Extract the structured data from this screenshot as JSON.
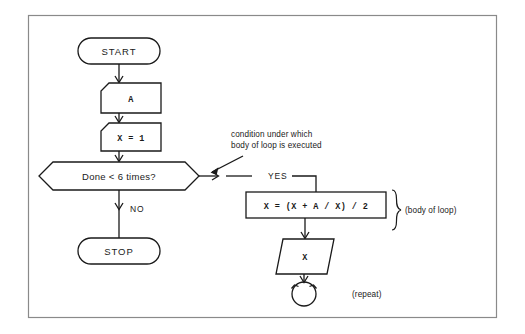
{
  "diagram": {
    "title_visible": false,
    "frame": {
      "present": true,
      "color": "#8a8a8a"
    },
    "ink_color": "#1a1a1a",
    "background": "#ffffff",
    "nodes": {
      "start": {
        "label": "START",
        "shape": "terminator"
      },
      "input_a": {
        "label": "A",
        "shape": "read-box"
      },
      "init_x": {
        "label": "X  =  1",
        "shape": "read-box"
      },
      "decision": {
        "label": "Done < 6 times?",
        "shape": "hexagon"
      },
      "stop": {
        "label": "STOP",
        "shape": "terminator"
      },
      "compute": {
        "label": "X  =  (X  +  A  /  X)  /  2",
        "shape": "rectangle"
      },
      "output_x": {
        "label": "X",
        "shape": "parallelogram"
      },
      "repeat_symbol": {
        "label": "",
        "shape": "circular-arrow"
      }
    },
    "edges": {
      "no_label": "NO",
      "yes_label": "YES"
    },
    "annotations": {
      "condition_note_line1": "condition under which",
      "condition_note_line2": "body of loop is executed",
      "body_of_loop": "(body of loop)",
      "repeat": "(repeat)"
    }
  }
}
